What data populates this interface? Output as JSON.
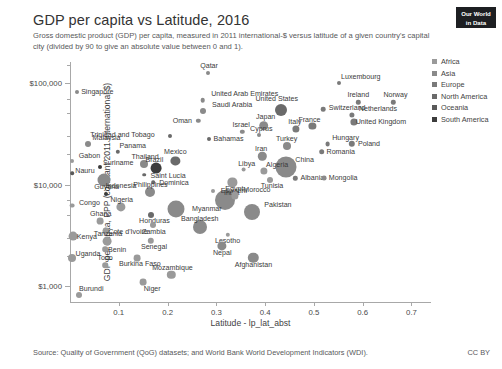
{
  "header": {
    "title": "GDP per capita vs Latitude, 2016",
    "subtitle": "Gross domestic product (GDP) per capita, measured in 2011 international-$ versus latitude of a given country's capital city (divided by 90 to give an absolute value between 0 and 1).",
    "logo_line1": "Our World",
    "logo_line2": "in Data"
  },
  "footer": {
    "source": "Source: Quality of Government (QoG) datasets; and World Bank World Development Indicators (WDI).",
    "license": "CC BY"
  },
  "legend": {
    "items": [
      {
        "label": "Africa",
        "color": "#9a9a9a"
      },
      {
        "label": "Asia",
        "color": "#8a8a8a"
      },
      {
        "label": "Europe",
        "color": "#7a7a7a"
      },
      {
        "label": "North America",
        "color": "#6a6a6a"
      },
      {
        "label": "Oceania",
        "color": "#5a5a5a"
      },
      {
        "label": "South America",
        "color": "#3c3c3c"
      }
    ]
  },
  "chart_data": {
    "type": "scatter",
    "title": "GDP per capita vs Latitude, 2016",
    "subtitle": "Gross domestic product (GDP) per capita, measured in 2011 international-$ versus latitude of a given country's capital city (divided by 90 to give an absolute value between 0 and 1).",
    "xlabel": "Latitude - lp_lat_abst",
    "ylabel": "GDP per capita, PPP (constant 2011 international $)",
    "yscale": "log",
    "ylim": [
      700,
      160000
    ],
    "xlim": [
      0.0,
      0.74
    ],
    "xticks": [
      0.1,
      0.2,
      0.3,
      0.4,
      0.5,
      0.6,
      0.7
    ],
    "xtick_labels": [
      "0.1",
      "0.2",
      "0.3",
      "0.4",
      "0.5",
      "0.6",
      "0.7"
    ],
    "yticks": [
      1000,
      10000,
      100000
    ],
    "ytick_labels": [
      "$1,000",
      "$10,000",
      "$100,000"
    ],
    "grid": false,
    "legend_position": "right",
    "size_encodes": "population",
    "points": [
      {
        "name": "Singapore",
        "x": 0.015,
        "y": 82000,
        "r": 2.0,
        "c": "#8a8a8a",
        "lx": 20,
        "ly": 0
      },
      {
        "name": "Qatar",
        "x": 0.283,
        "y": 125000,
        "r": 2.0,
        "c": "#8a8a8a",
        "lx": 1,
        "ly": -7
      },
      {
        "name": "Luxembourg",
        "x": 0.551,
        "y": 100000,
        "r": 2.0,
        "c": "#7a7a7a",
        "lx": 22,
        "ly": -6
      },
      {
        "name": "United Arab Emirates",
        "x": 0.272,
        "y": 67000,
        "r": 2.3,
        "c": "#8a8a8a",
        "lx": 42,
        "ly": -6
      },
      {
        "name": "Saudi Arabia",
        "x": 0.273,
        "y": 53000,
        "r": 3.0,
        "c": "#8a8a8a",
        "lx": 29,
        "ly": -6
      },
      {
        "name": "Ireland",
        "x": 0.591,
        "y": 64000,
        "r": 2.2,
        "c": "#7a7a7a",
        "lx": 0,
        "ly": -7
      },
      {
        "name": "Norway",
        "x": 0.663,
        "y": 64000,
        "r": 2.2,
        "c": "#7a7a7a",
        "lx": 2,
        "ly": -7
      },
      {
        "name": "United States",
        "x": 0.432,
        "y": 54000,
        "r": 6.0,
        "c": "#6a6a6a",
        "lx": -4,
        "ly": -11
      },
      {
        "name": "Switzerland",
        "x": 0.519,
        "y": 55000,
        "r": 2.3,
        "c": "#7a7a7a",
        "lx": 24,
        "ly": -1
      },
      {
        "name": "Netherlands",
        "x": 0.578,
        "y": 48000,
        "r": 2.6,
        "c": "#7a7a7a",
        "lx": 26,
        "ly": -6
      },
      {
        "name": "United Kingdom",
        "x": 0.582,
        "y": 41000,
        "r": 3.6,
        "c": "#7a7a7a",
        "lx": 27,
        "ly": 0
      },
      {
        "name": "Oman",
        "x": 0.263,
        "y": 42000,
        "r": 2.2,
        "c": "#8a8a8a",
        "lx": -16,
        "ly": 0
      },
      {
        "name": "Japan",
        "x": 0.397,
        "y": 38000,
        "r": 4.8,
        "c": "#8a8a8a",
        "lx": 2,
        "ly": -9
      },
      {
        "name": "Italy",
        "x": 0.463,
        "y": 35000,
        "r": 3.6,
        "c": "#7a7a7a",
        "lx": -1,
        "ly": -7
      },
      {
        "name": "France",
        "x": 0.497,
        "y": 38000,
        "r": 3.6,
        "c": "#7a7a7a",
        "lx": -3,
        "ly": -6
      },
      {
        "name": "Israel",
        "x": 0.353,
        "y": 33000,
        "r": 2.2,
        "c": "#8a8a8a",
        "lx": -1,
        "ly": -7
      },
      {
        "name": "Cyprus",
        "x": 0.388,
        "y": 31000,
        "r": 2.0,
        "c": "#8a8a8a",
        "lx": 2,
        "ly": -6
      },
      {
        "name": "Bahamas",
        "x": 0.284,
        "y": 28000,
        "r": 2.0,
        "c": "#6a6a6a",
        "lx": 20,
        "ly": 0
      },
      {
        "name": "Trinidad and Tobago",
        "x": 0.206,
        "y": 30000,
        "r": 2.0,
        "c": "#6a6a6a",
        "lx": -48,
        "ly": -1
      },
      {
        "name": "Hungary",
        "x": 0.528,
        "y": 25000,
        "r": 2.4,
        "c": "#7a7a7a",
        "lx": 18,
        "ly": -6
      },
      {
        "name": "Poland",
        "x": 0.578,
        "y": 25000,
        "r": 3.2,
        "c": "#7a7a7a",
        "lx": 17,
        "ly": 0
      },
      {
        "name": "Turkey",
        "x": 0.444,
        "y": 24000,
        "r": 4.0,
        "c": "#8a8a8a",
        "lx": 0,
        "ly": -7
      },
      {
        "name": "Romania",
        "x": 0.516,
        "y": 21000,
        "r": 2.8,
        "c": "#7a7a7a",
        "lx": 19,
        "ly": 0
      },
      {
        "name": "Malaysia",
        "x": 0.036,
        "y": 25000,
        "r": 3.0,
        "c": "#8a8a8a",
        "lx": 19,
        "ly": -6
      },
      {
        "name": "Panama",
        "x": 0.098,
        "y": 21000,
        "r": 2.2,
        "c": "#6a6a6a",
        "lx": 15,
        "ly": -6
      },
      {
        "name": "Mexico",
        "x": 0.216,
        "y": 17000,
        "r": 4.6,
        "c": "#6a6a6a",
        "lx": 0,
        "ly": -9
      },
      {
        "name": "Iran",
        "x": 0.394,
        "y": 19000,
        "r": 4.2,
        "c": "#8a8a8a",
        "lx": -1,
        "ly": -7
      },
      {
        "name": "China",
        "x": 0.442,
        "y": 15000,
        "r": 10.5,
        "c": "#8a8a8a",
        "lx": 19,
        "ly": -7
      },
      {
        "name": "Thailand",
        "x": 0.152,
        "y": 16000,
        "r": 4.0,
        "c": "#8a8a8a",
        "lx": 1,
        "ly": -7
      },
      {
        "name": "Gabon",
        "x": 0.005,
        "y": 17000,
        "r": 2.0,
        "c": "#9a9a9a",
        "lx": 17,
        "ly": -5
      },
      {
        "name": "Brazil",
        "x": 0.177,
        "y": 14500,
        "r": 5.4,
        "c": "#3c3c3c",
        "lx": -2,
        "ly": -8
      },
      {
        "name": "Suriname",
        "x": 0.062,
        "y": 15000,
        "r": 2.0,
        "c": "#3c3c3c",
        "lx": 18,
        "ly": -4
      },
      {
        "name": "Nauru",
        "x": 0.004,
        "y": 13000,
        "r": 1.8,
        "c": "#5a5a5a",
        "lx": 13,
        "ly": -2
      },
      {
        "name": "Saint Lucia",
        "x": 0.152,
        "y": 12500,
        "r": 1.8,
        "c": "#6a6a6a",
        "lx": 24,
        "ly": 1
      },
      {
        "name": "Libya",
        "x": 0.356,
        "y": 14000,
        "r": 2.4,
        "c": "#9a9a9a",
        "lx": 3,
        "ly": -6
      },
      {
        "name": "Algeria",
        "x": 0.398,
        "y": 13500,
        "r": 3.6,
        "c": "#9a9a9a",
        "lx": 13,
        "ly": -6
      },
      {
        "name": "Tunisia",
        "x": 0.41,
        "y": 11000,
        "r": 3.0,
        "c": "#9a9a9a",
        "lx": 2,
        "ly": 6
      },
      {
        "name": "Albania",
        "x": 0.462,
        "y": 11500,
        "r": 2.2,
        "c": "#7a7a7a",
        "lx": 17,
        "ly": 0
      },
      {
        "name": "Mongolia",
        "x": 0.521,
        "y": 11500,
        "r": 2.4,
        "c": "#8a8a8a",
        "lx": 19,
        "ly": 0
      },
      {
        "name": "Indonesia",
        "x": 0.07,
        "y": 11000,
        "r": 6.5,
        "c": "#8a8a8a",
        "lx": 17,
        "ly": 6
      },
      {
        "name": "Dominica",
        "x": 0.17,
        "y": 10500,
        "r": 1.8,
        "c": "#6a6a6a",
        "lx": 21,
        "ly": 1
      },
      {
        "name": "Egypt",
        "x": 0.333,
        "y": 10500,
        "r": 4.6,
        "c": "#9a9a9a",
        "lx": 2,
        "ly": 7
      },
      {
        "name": "Guyana",
        "x": 0.073,
        "y": 8000,
        "r": 2.0,
        "c": "#3c3c3c",
        "lx": 1,
        "ly": -7
      },
      {
        "name": "Philippines",
        "x": 0.163,
        "y": 8400,
        "r": 5.0,
        "c": "#8a8a8a",
        "lx": 1,
        "ly": -7
      },
      {
        "name": "India",
        "x": 0.317,
        "y": 7000,
        "r": 10.0,
        "c": "#8a8a8a",
        "lx": 7,
        "ly": -7
      },
      {
        "name": "Eswatini",
        "x": 0.293,
        "y": 8700,
        "r": 2.0,
        "c": "#9a9a9a",
        "lx": 21,
        "ly": 0
      },
      {
        "name": "Morocco",
        "x": 0.338,
        "y": 7800,
        "r": 3.6,
        "c": "#9a9a9a",
        "lx": 22,
        "ly": -5
      },
      {
        "name": "Congo",
        "x": 0.005,
        "y": 6200,
        "r": 2.4,
        "c": "#9a9a9a",
        "lx": 17,
        "ly": -3
      },
      {
        "name": "Nigeria",
        "x": 0.104,
        "y": 6000,
        "r": 4.6,
        "c": "#9a9a9a",
        "lx": 1,
        "ly": -7
      },
      {
        "name": "Myanmar",
        "x": 0.217,
        "y": 5800,
        "r": 8.5,
        "c": "#8a8a8a",
        "lx": 31,
        "ly": 0
      },
      {
        "name": "Pakistan",
        "x": 0.373,
        "y": 5400,
        "r": 8.0,
        "c": "#8a8a8a",
        "lx": 26,
        "ly": -7
      },
      {
        "name": "Honduras",
        "x": 0.167,
        "y": 5000,
        "r": 3.0,
        "c": "#6a6a6a",
        "lx": 3,
        "ly": 6
      },
      {
        "name": "Ghana",
        "x": 0.061,
        "y": 4400,
        "r": 3.4,
        "c": "#9a9a9a",
        "lx": 1,
        "ly": -7
      },
      {
        "name": "Zambia",
        "x": 0.17,
        "y": 4000,
        "r": 3.0,
        "c": "#9a9a9a",
        "lx": 1,
        "ly": 7
      },
      {
        "name": "Bangladesh",
        "x": 0.266,
        "y": 3800,
        "r": 7.0,
        "c": "#8a8a8a",
        "lx": 0,
        "ly": -8
      },
      {
        "name": "Kenya",
        "x": 0.006,
        "y": 3100,
        "r": 4.4,
        "c": "#9a9a9a",
        "lx": 14,
        "ly": 1
      },
      {
        "name": "Cote d'Ivoire",
        "x": 0.074,
        "y": 3500,
        "r": 3.4,
        "c": "#9a9a9a",
        "lx": 22,
        "ly": 1
      },
      {
        "name": "Tanzania",
        "x": 0.076,
        "y": 2800,
        "r": 4.4,
        "c": "#9a9a9a",
        "lx": 1,
        "ly": -7
      },
      {
        "name": "Senegal",
        "x": 0.166,
        "y": 2800,
        "r": 3.2,
        "c": "#9a9a9a",
        "lx": 3,
        "ly": 6
      },
      {
        "name": "Lesotho",
        "x": 0.323,
        "y": 3200,
        "r": 2.2,
        "c": "#9a9a9a",
        "lx": 0,
        "ly": 6
      },
      {
        "name": "Benin",
        "x": 0.072,
        "y": 2300,
        "r": 2.8,
        "c": "#9a9a9a",
        "lx": 12,
        "ly": 1
      },
      {
        "name": "Nepal",
        "x": 0.312,
        "y": 2500,
        "r": 4.6,
        "c": "#8a8a8a",
        "lx": 0,
        "ly": 7
      },
      {
        "name": "Uganda",
        "x": 0.004,
        "y": 1900,
        "r": 4.0,
        "c": "#9a9a9a",
        "lx": 16,
        "ly": -4
      },
      {
        "name": "Burkina Faso",
        "x": 0.137,
        "y": 1900,
        "r": 3.4,
        "c": "#9a9a9a",
        "lx": 3,
        "ly": 6
      },
      {
        "name": "Togo",
        "x": 0.072,
        "y": 1600,
        "r": 2.8,
        "c": "#9a9a9a",
        "lx": 0,
        "ly": -7
      },
      {
        "name": "Afghanistan",
        "x": 0.376,
        "y": 1900,
        "r": 5.2,
        "c": "#8a8a8a",
        "lx": 0,
        "ly": 7
      },
      {
        "name": "Mozambique",
        "x": 0.208,
        "y": 1300,
        "r": 4.2,
        "c": "#9a9a9a",
        "lx": 1,
        "ly": -7
      },
      {
        "name": "Niger",
        "x": 0.15,
        "y": 1100,
        "r": 3.4,
        "c": "#9a9a9a",
        "lx": 9,
        "ly": 7
      },
      {
        "name": "Burundi",
        "x": 0.019,
        "y": 820,
        "r": 3.0,
        "c": "#9a9a9a",
        "lx": 12,
        "ly": -6
      }
    ]
  }
}
